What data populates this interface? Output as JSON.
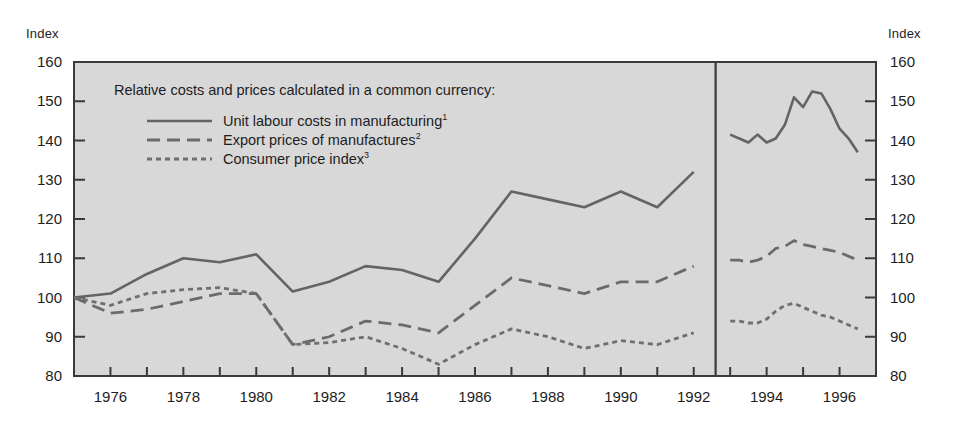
{
  "axis_titles": {
    "left": "Index",
    "right": "Index"
  },
  "legend": {
    "title": "Relative costs and prices calculated in a common currency:",
    "entries": [
      {
        "label": "Unit labour costs in manufacturing",
        "note": "1",
        "style": "solid",
        "color": "#646464"
      },
      {
        "label": "Export prices of manufactures",
        "note": "2",
        "style": "dashed",
        "color": "#6b6b6b"
      },
      {
        "label": "Consumer price index",
        "note": "3",
        "style": "dotted",
        "color": "#6f6f6f"
      }
    ]
  },
  "chart_data": {
    "type": "line",
    "title": "",
    "xlabel": "",
    "ylabel": "Index",
    "ylim": [
      80,
      160
    ],
    "yticks": [
      80,
      90,
      100,
      110,
      120,
      130,
      140,
      150,
      160
    ],
    "xlim": [
      1975,
      1997
    ],
    "xticks": [
      1976,
      1978,
      1980,
      1982,
      1984,
      1986,
      1988,
      1990,
      1992,
      1994,
      1996
    ],
    "xtick_minor_step": 1,
    "grid": false,
    "legend_position": "upper-left",
    "panel_break_x": 1992.6,
    "plot_bgcolor": "#d8d8d8",
    "frame_color": "#3a3a3a",
    "annual_series": [
      {
        "name": "Unit labour costs in manufacturing",
        "style": "solid",
        "x": [
          1975,
          1976,
          1977,
          1978,
          1979,
          1980,
          1981,
          1982,
          1983,
          1984,
          1985,
          1986,
          1987,
          1988,
          1989,
          1990,
          1991,
          1992
        ],
        "values": [
          100,
          101,
          106,
          110,
          109,
          111,
          101.5,
          104,
          108,
          107,
          104,
          115,
          127,
          125,
          123,
          127,
          123,
          132
        ]
      },
      {
        "name": "Export prices of manufactures",
        "style": "dashed",
        "x": [
          1975,
          1976,
          1977,
          1978,
          1979,
          1980,
          1981,
          1982,
          1983,
          1984,
          1985,
          1986,
          1987,
          1988,
          1989,
          1990,
          1991,
          1992
        ],
        "values": [
          100,
          96,
          97,
          99,
          101,
          101,
          88,
          90,
          94,
          93,
          91,
          98,
          105,
          103,
          101,
          104,
          104,
          108
        ]
      },
      {
        "name": "Consumer price index",
        "style": "dotted",
        "x": [
          1975,
          1976,
          1977,
          1978,
          1979,
          1980,
          1981,
          1982,
          1983,
          1984,
          1985,
          1986,
          1987,
          1988,
          1989,
          1990,
          1991,
          1992
        ],
        "values": [
          100,
          98,
          101,
          102,
          102.5,
          101,
          88,
          88.5,
          90,
          87,
          83,
          88,
          92,
          90,
          87,
          89,
          88,
          91
        ]
      }
    ],
    "quarterly_series": [
      {
        "name": "Unit labour costs in manufacturing",
        "style": "solid",
        "x": [
          1993.0,
          1993.25,
          1993.5,
          1993.75,
          1994.0,
          1994.25,
          1994.5,
          1994.75,
          1995.0,
          1995.25,
          1995.5,
          1995.75,
          1996.0,
          1996.25,
          1996.5
        ],
        "values": [
          141.5,
          140.5,
          139.5,
          141.5,
          139.5,
          140.5,
          144,
          151,
          148.5,
          152.5,
          152,
          148,
          143,
          140.5,
          137
        ]
      },
      {
        "name": "Export prices of manufactures",
        "style": "dashed",
        "x": [
          1993.0,
          1993.25,
          1993.5,
          1993.75,
          1994.0,
          1994.25,
          1994.5,
          1994.75,
          1995.0,
          1995.25,
          1995.5,
          1995.75,
          1996.0,
          1996.25,
          1996.5
        ],
        "values": [
          109.5,
          109.5,
          109,
          109.5,
          110.5,
          112.5,
          113,
          114.5,
          113.5,
          113,
          112.5,
          112,
          111.5,
          110.5,
          109.5
        ]
      },
      {
        "name": "Consumer price index",
        "style": "dotted",
        "x": [
          1993.0,
          1993.25,
          1993.5,
          1993.75,
          1994.0,
          1994.25,
          1994.5,
          1994.75,
          1995.0,
          1995.25,
          1995.5,
          1995.75,
          1996.0,
          1996.25,
          1996.5
        ],
        "values": [
          94,
          94,
          93.5,
          93.5,
          94.5,
          96.5,
          98,
          98.5,
          97.5,
          96.5,
          95.5,
          95,
          94,
          93,
          92
        ]
      }
    ]
  }
}
